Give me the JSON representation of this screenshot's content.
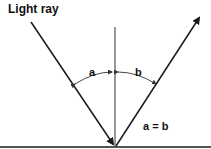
{
  "diagram": {
    "title": "Light ray",
    "angle_labels": {
      "incident": "a",
      "reflected": "b"
    },
    "equation": "a = b",
    "elements": {
      "incident_ray": "incident-ray",
      "reflected_ray": "reflected-ray",
      "normal": "normal-line",
      "surface": "reflective-surface"
    },
    "colors": {
      "line": "#1a1a1a",
      "normal": "#555555",
      "arc": "#333333",
      "background": "#ffffff"
    }
  }
}
